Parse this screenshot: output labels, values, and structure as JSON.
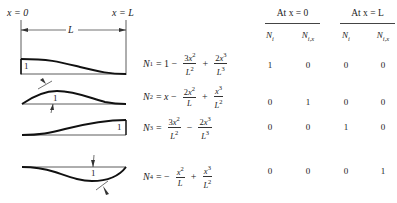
{
  "figure": {
    "left_label": "x = 0",
    "right_label": "x = L",
    "span_label": "L",
    "unit_label": "1"
  },
  "equations": [
    {
      "lhs": "N",
      "sub": "1",
      "terms": [
        "= 1 −",
        "3x²/L²",
        "+",
        "2x³/L³"
      ]
    },
    {
      "lhs": "N",
      "sub": "2",
      "terms": [
        "= x −",
        "2x²/L",
        "+",
        "x³/L²"
      ]
    },
    {
      "lhs": "N",
      "sub": "3",
      "terms": [
        "=",
        "3x²/L²",
        "−",
        "2x³/L³"
      ]
    },
    {
      "lhs": "N",
      "sub": "4",
      "terms": [
        "= −",
        "x²/L",
        "+",
        "x³/L²"
      ]
    }
  ],
  "table": {
    "group_headers": [
      "At x = 0",
      "At x = L"
    ],
    "col_headers": [
      "N_i",
      "N_i,x",
      "N_i",
      "N_i,x"
    ],
    "rows": [
      [
        "1",
        "0",
        "0",
        "0"
      ],
      [
        "0",
        "1",
        "0",
        "0"
      ],
      [
        "0",
        "0",
        "1",
        "0"
      ],
      [
        "0",
        "0",
        "0",
        "1"
      ]
    ]
  }
}
